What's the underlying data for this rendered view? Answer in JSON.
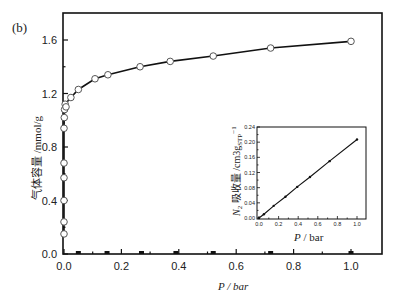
{
  "chart_data": [
    {
      "type": "line",
      "panel_label": "(b)",
      "title": "",
      "xlabel": "P / bar",
      "ylabel": "气体容量 /mmol/g",
      "xlim": [
        0.0,
        1.1
      ],
      "ylim": [
        0.0,
        1.8
      ],
      "xticks": [
        "0.0",
        "0.2",
        "0.4",
        "0.6",
        "0.8",
        "1.0"
      ],
      "yticks": [
        "0.0",
        "0.4",
        "0.8",
        "1.2",
        "1.6"
      ],
      "grid": false,
      "series": [
        {
          "name": "CO2 adsorption",
          "marker": "open-circle",
          "x": [
            0.0,
            0.0,
            0.0,
            0.0,
            0.0,
            0.0,
            0.001,
            0.002,
            0.004,
            0.007,
            0.024,
            0.05,
            0.108,
            0.153,
            0.265,
            0.37,
            0.52,
            0.72,
            1.0
          ],
          "y": [
            0.15,
            0.24,
            0.4,
            0.57,
            0.68,
            0.94,
            1.02,
            1.08,
            1.12,
            1.1,
            1.17,
            1.23,
            1.31,
            1.34,
            1.4,
            1.44,
            1.48,
            1.54,
            1.59
          ]
        },
        {
          "name": "N2 adsorption",
          "marker": "filled-square",
          "x": [
            0.05,
            0.15,
            0.27,
            0.39,
            0.52,
            0.72,
            1.0
          ],
          "y": [
            0.01,
            0.01,
            0.01,
            0.01,
            0.01,
            0.01,
            0.01
          ]
        }
      ]
    },
    {
      "type": "line",
      "role": "inset",
      "xlabel": "P / bar",
      "ylabel": "N2 吸收量 /cm3gSTP-1",
      "ylabel_parts": {
        "n": "N",
        "sub": "2",
        "cn": "吸收量",
        "unit": "/cm3g",
        "unit_sub": "STP",
        "unit_sup": "−1"
      },
      "xlim": [
        0.0,
        1.1
      ],
      "ylim": [
        0.0,
        0.24
      ],
      "xticks": [
        "0.0",
        "0.2",
        "0.4",
        "0.6",
        "0.8",
        "1.0"
      ],
      "yticks": [
        "0.00",
        "0.04",
        "0.08",
        "0.12",
        "0.16",
        "0.20",
        "0.24"
      ],
      "series": [
        {
          "name": "N2 uptake",
          "marker": "small-dot",
          "x": [
            0.0,
            0.05,
            0.15,
            0.27,
            0.39,
            0.52,
            0.72,
            1.0
          ],
          "y": [
            0.0,
            0.01,
            0.032,
            0.056,
            0.082,
            0.108,
            0.15,
            0.207
          ]
        }
      ]
    }
  ],
  "colors": {
    "line": "#111111",
    "axis": "#111111",
    "marker_fill": "#ffffff",
    "marker_stroke": "#555555"
  }
}
